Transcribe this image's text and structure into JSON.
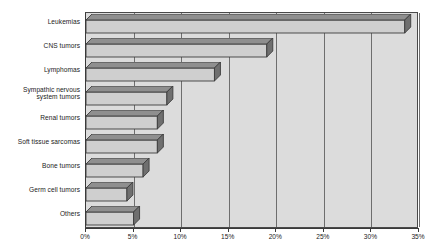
{
  "chart_data": {
    "type": "bar",
    "orientation": "horizontal",
    "title": "",
    "xlabel": "",
    "ylabel": "",
    "xlim": [
      0,
      35
    ],
    "grid": true,
    "legend": null,
    "tick_suffix": "%",
    "xticks": [
      0,
      5,
      10,
      15,
      20,
      25,
      30,
      35
    ],
    "xtick_labels": [
      "0%",
      "5%",
      "10%",
      "15%",
      "20%",
      "25%",
      "30%",
      "35%"
    ],
    "categories": [
      "Leukemias",
      "CNS tumors",
      "Lymphomas",
      "Sympathic nervous\nsystem tumors",
      "Renal tumors",
      "Soft tissue sarcomas",
      "Bone tumors",
      "Germ cell tumors",
      "Others"
    ],
    "values": [
      33.5,
      19.0,
      13.5,
      8.5,
      7.5,
      7.5,
      6.0,
      4.3,
      5.0
    ],
    "colors": {
      "bar_face": "#cfcfcf",
      "bar_top": "#8f8f8f",
      "bar_side": "#6f6f6f",
      "bar_outline": "#3d3d3d",
      "plot_background": "#dcdcdc",
      "gridline": "#6e6e6e",
      "axis": "#3a3a3a",
      "page_background": "#ffffff",
      "text": "#1b1b1b"
    }
  }
}
